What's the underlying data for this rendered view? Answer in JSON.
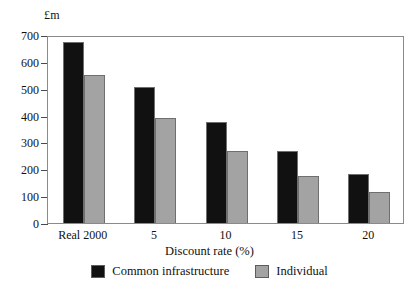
{
  "chart_data": {
    "type": "bar",
    "title": "",
    "unit_label": "£m",
    "xlabel": "Discount rate (%)",
    "ylabel": "",
    "categories": [
      "Real 2000",
      "5",
      "10",
      "15",
      "20"
    ],
    "series": [
      {
        "name": "Common infrastructure",
        "color": "#111111",
        "values": [
          675,
          505,
          375,
          270,
          183
        ]
      },
      {
        "name": "Individual",
        "color": "#a3a3a3",
        "values": [
          550,
          390,
          270,
          176,
          116
        ]
      }
    ],
    "ylim": [
      0,
      700
    ],
    "yticks": [
      0,
      100,
      200,
      300,
      400,
      500,
      600,
      700
    ],
    "ytick_labels": [
      "0",
      "100",
      "200",
      "300",
      "400",
      "500",
      "600",
      "700"
    ],
    "grid": false,
    "legend_position": "bottom-center"
  },
  "legend": {
    "items": [
      {
        "label": "Common infrastructure",
        "swatch": "black"
      },
      {
        "label": "Individual",
        "swatch": "gray"
      }
    ]
  }
}
